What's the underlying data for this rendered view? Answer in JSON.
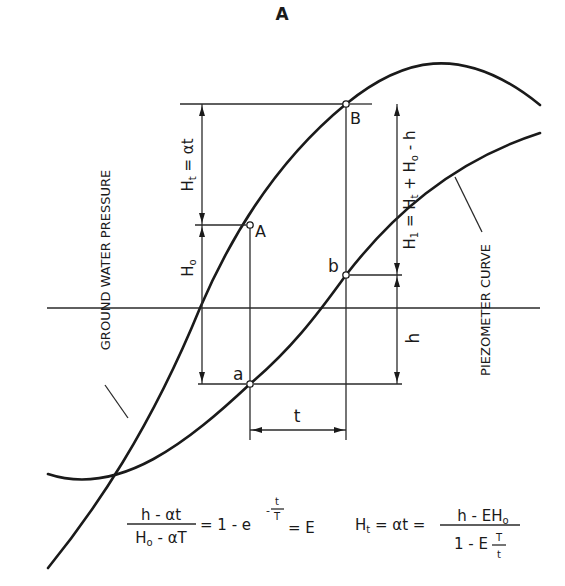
{
  "figure": {
    "title": "A",
    "points": {
      "upper_B": "B",
      "upper_A": "A",
      "lower_b": "b",
      "lower_a": "a"
    },
    "curve_labels": {
      "ground_water": "GROUND WATER PRESSURE",
      "piezometer": "PIEZOMETER CURVE"
    },
    "dimensions": {
      "ht_label_main": "H",
      "ht_label_sub": "t",
      "ht_label_rest": " = αt",
      "ho_label_main": "H",
      "ho_label_sub": "o",
      "h1_label_main": "H",
      "h1_label_sub": "1",
      "h1_label_rest": " = H",
      "h1_label_sub2": "t",
      "h1_label_rest2": " + H",
      "h1_label_sub3": "o",
      "h1_label_rest3": " - h",
      "h_label": "h",
      "t_label": "t"
    },
    "equations": {
      "eq1_num": "h - αt",
      "eq1_den_main": "H",
      "eq1_den_sub": "o",
      "eq1_den_rest": " - αT",
      "eq1_mid": "= 1 - e",
      "eq1_exp_minus": "-",
      "eq1_exp_num": "t",
      "eq1_exp_den": "T",
      "eq1_end": "= E",
      "eq2_lhs_main": "H",
      "eq2_lhs_sub": "t",
      "eq2_lhs_rest": " = αt =",
      "eq2_num_main": "h - EH",
      "eq2_num_sub": "o",
      "eq2_den_main": "1 - E",
      "eq2_den_frac_num": "T",
      "eq2_den_frac_den": "t"
    }
  }
}
